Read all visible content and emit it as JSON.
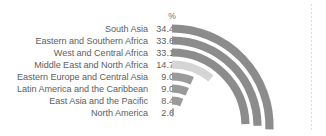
{
  "chart_data": {
    "type": "bar",
    "title": "",
    "subtitle": "",
    "unit_header": "%",
    "xlabel": "",
    "ylabel": "",
    "orientation": "horizontal-curved",
    "xlim": [
      0,
      34.4
    ],
    "grid": false,
    "legend": "none",
    "categories": [
      "South Asia",
      "Eastern and Southern Africa",
      "West and Central Africa",
      "Middle East and North Africa",
      "Eastern Europe and Central Asia",
      "Latin America and the Caribbean",
      "East Asia and the Pacific",
      "North America"
    ],
    "values": [
      34.4,
      33.6,
      33.1,
      14.7,
      9.0,
      9.0,
      8.4,
      2.6
    ],
    "value_labels": [
      "34.4",
      "33.6",
      "33.1",
      "14.7",
      "9.0",
      "9.0",
      "8.4",
      "2.6"
    ],
    "bar_colors": [
      "#8c8c8c",
      "#8c8c8c",
      "#8c8c8c",
      "#d5d5d5",
      "#9a9a9a",
      "#9a9a9a",
      "#9a9a9a",
      "#9a9a9a"
    ],
    "annotations": []
  },
  "decor": {
    "dotted_rule_color": "#dcdcdc"
  }
}
